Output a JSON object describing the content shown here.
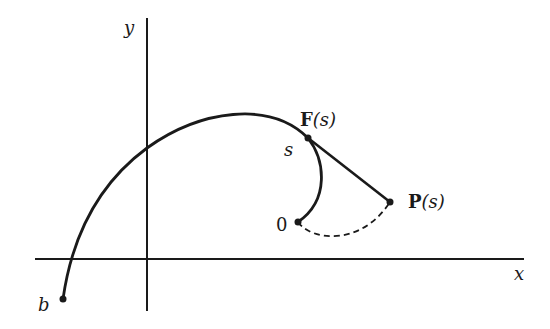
{
  "diagram": {
    "axes": {
      "x_label": "x",
      "y_label": "y"
    },
    "points": {
      "F": {
        "label_main": "F",
        "label_arg": "(s)"
      },
      "P": {
        "label_main": "P",
        "label_arg": "(s)"
      },
      "origin_point": {
        "label": "0"
      },
      "b": {
        "label": "b"
      },
      "s": {
        "label": "s"
      }
    },
    "elements": [
      "curve from b through y-axis to F(s) and on to 0",
      "tangent segment from F(s) to P(s)",
      "dashed involute arc from 0 to P(s)"
    ],
    "colors": {
      "ink": "#1a1a1a",
      "background": "#ffffff"
    }
  }
}
